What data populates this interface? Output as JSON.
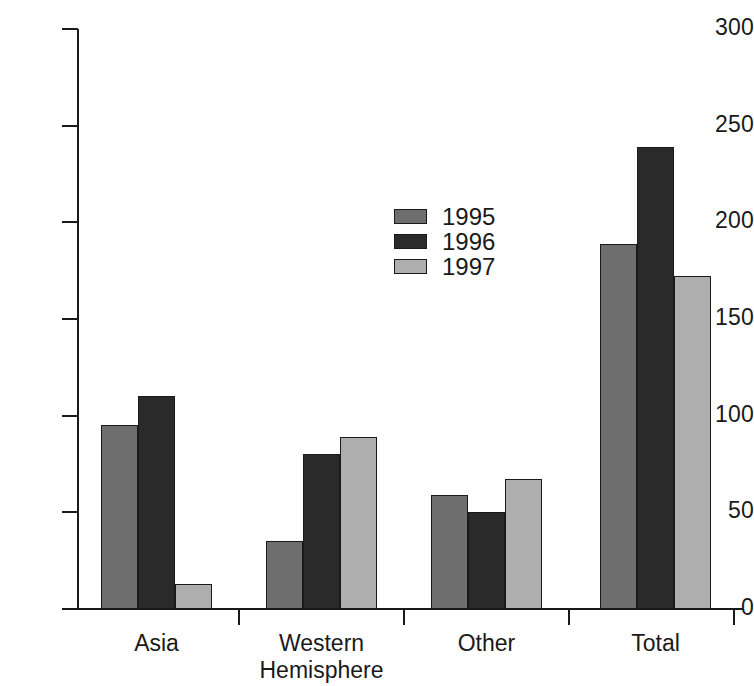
{
  "chart_data": {
    "type": "bar",
    "title": "",
    "subtitle": "",
    "xlabel": "",
    "ylabel": "",
    "categories": [
      "Asia",
      "Western\nHemisphere",
      "Other",
      "Total"
    ],
    "series": [
      {
        "name": "1995",
        "color": "#6e6e6e",
        "values": [
          95,
          35,
          59,
          189
        ]
      },
      {
        "name": "1996",
        "color": "#2a2a2a",
        "values": [
          110,
          80,
          50,
          239
        ]
      },
      {
        "name": "1997",
        "color": "#aeaeae",
        "values": [
          13,
          89,
          67,
          172
        ]
      }
    ],
    "ylim": [
      0,
      300
    ],
    "yticks": [
      0,
      50,
      100,
      150,
      200,
      250,
      300
    ],
    "ytick_labels": [
      "0",
      "50",
      "100",
      "150",
      "200",
      "250",
      "300"
    ],
    "grid": false,
    "legend_position": "center",
    "legend_entries": [
      "1995",
      "1996",
      "1997"
    ],
    "annotations": []
  },
  "axis": {
    "y_tick_labels": [
      "300",
      "250",
      "200",
      "150",
      "100",
      "50",
      "0"
    ],
    "x_tick_labels": [
      "Asia",
      "Western\nHemisphere",
      "Other",
      "Total"
    ]
  },
  "legend": {
    "items": [
      {
        "label": "1995",
        "color": "#6e6e6e"
      },
      {
        "label": "1996",
        "color": "#2a2a2a"
      },
      {
        "label": "1997",
        "color": "#aeaeae"
      }
    ]
  }
}
